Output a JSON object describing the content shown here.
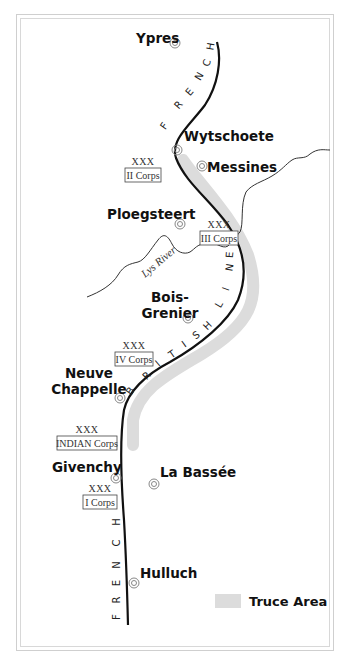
{
  "map": {
    "title": "British Front Line — Christmas Truce",
    "towns": [
      {
        "name": "Ypres",
        "lines": [
          "Ypres"
        ],
        "x": 136,
        "y": 43,
        "mx": 175,
        "my": 43,
        "anchor": "start"
      },
      {
        "name": "Wytschoete",
        "lines": [
          "Wytschoete"
        ],
        "x": 184,
        "y": 141,
        "mx": 177,
        "my": 150,
        "anchor": "start"
      },
      {
        "name": "Messines",
        "lines": [
          "Messines"
        ],
        "x": 207,
        "y": 172,
        "mx": 202,
        "my": 166,
        "anchor": "start"
      },
      {
        "name": "Ploegsteert",
        "lines": [
          "Ploegsteert"
        ],
        "x": 107,
        "y": 219,
        "mx": 180,
        "my": 224,
        "anchor": "start"
      },
      {
        "name": "Bois-Grenier",
        "lines": [
          "Bois-",
          "Grenier"
        ],
        "x": 170,
        "y": 302,
        "mx": 188,
        "my": 318,
        "anchor": "middle"
      },
      {
        "name": "Neuve Chappelle",
        "lines": [
          "Neuve",
          "Chappelle"
        ],
        "x": 89,
        "y": 378,
        "mx": 120,
        "my": 398,
        "anchor": "middle"
      },
      {
        "name": "Givenchy",
        "lines": [
          "Givenchy"
        ],
        "x": 52,
        "y": 472,
        "mx": 116,
        "my": 478,
        "anchor": "start"
      },
      {
        "name": "La Bassée",
        "lines": [
          "La Bassée"
        ],
        "x": 160,
        "y": 477,
        "mx": 154,
        "my": 484,
        "anchor": "start"
      },
      {
        "name": "Hulluch",
        "lines": [
          "Hulluch"
        ],
        "x": 140,
        "y": 578,
        "mx": 134,
        "my": 583,
        "anchor": "start"
      }
    ],
    "corps": [
      {
        "xxx": "XXX",
        "name": "II Corps",
        "x": 125,
        "y": 168,
        "w": 36,
        "h": 14
      },
      {
        "xxx": "XXX",
        "name": "III Corps",
        "x": 200,
        "y": 231,
        "w": 38,
        "h": 14
      },
      {
        "xxx": "XXX",
        "name": "IV Corps",
        "x": 115,
        "y": 352,
        "w": 38,
        "h": 14
      },
      {
        "xxx": "XXX",
        "name": "INDIAN Corps",
        "x": 57,
        "y": 436,
        "w": 60,
        "h": 14
      },
      {
        "xxx": "XXX",
        "name": "I Corps",
        "x": 83,
        "y": 495,
        "w": 34,
        "h": 14
      }
    ],
    "front_line_labels": {
      "french_north": [
        "F",
        "R",
        "E",
        "N",
        "C",
        "H"
      ],
      "british": [
        "B",
        "R",
        "I",
        "T",
        "I",
        "S",
        "H",
        "L",
        "I",
        "N",
        "E"
      ],
      "french_south": [
        "F",
        "R",
        "E",
        "N",
        "C",
        "H"
      ]
    },
    "river": {
      "name": "Lys River"
    },
    "legend": {
      "label": "Truce Area",
      "swatch_color": "#d9d9d9"
    },
    "colors": {
      "line": "#111111",
      "truce_area": "#dcdcdc",
      "river": "#333333",
      "frame": "#c8c8c8",
      "town_marker": "#888888"
    }
  }
}
